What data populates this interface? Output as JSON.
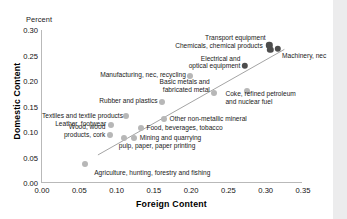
{
  "chart_data": {
    "type": "scatter",
    "title": "",
    "unit_label": "Percent",
    "xlabel": "Foreign Content",
    "ylabel": "Domestic Content",
    "xlim": [
      0.0,
      0.35
    ],
    "ylim": [
      0.0,
      0.3
    ],
    "xticks": [
      "0.00",
      "0.05",
      "0.10",
      "0.15",
      "0.20",
      "0.25",
      "0.30",
      "0.35"
    ],
    "yticks": [
      "0.00",
      "0.05",
      "0.10",
      "0.15",
      "0.20",
      "0.25",
      "0.30"
    ],
    "grid": false,
    "legend": "none",
    "marker_color": "#b7b7b7",
    "marker_color_highlight": "#4d4d4d",
    "trendline": {
      "x0": 0.075,
      "y0": 0.055,
      "x1": 0.325,
      "y1": 0.262
    },
    "points": [
      {
        "label": "Transport equipment",
        "x": 0.305,
        "y": 0.27,
        "highlight": true
      },
      {
        "label": "Chemicals, chemical products",
        "x": 0.306,
        "y": 0.261,
        "highlight": true
      },
      {
        "label": "Machinery, nec",
        "x": 0.316,
        "y": 0.263,
        "highlight": true
      },
      {
        "label": "Electrical and\noptical equipment",
        "x": 0.272,
        "y": 0.23,
        "highlight": true
      },
      {
        "label": "Manufacturing, nec, recycling",
        "x": 0.199,
        "y": 0.21,
        "highlight": false
      },
      {
        "label": "Coke, refined petroleum\nand nuclear fuel",
        "x": 0.275,
        "y": 0.181,
        "highlight": false
      },
      {
        "label": "Basic metals and\nfabricated metal",
        "x": 0.231,
        "y": 0.176,
        "highlight": false
      },
      {
        "label": "Rubber and plastics",
        "x": 0.161,
        "y": 0.158,
        "highlight": false
      },
      {
        "label": "Textiles and textile products",
        "x": 0.112,
        "y": 0.131,
        "highlight": false
      },
      {
        "label": "Other non-metallic mineral",
        "x": 0.164,
        "y": 0.125,
        "highlight": false
      },
      {
        "label": "Leather, footwear",
        "x": 0.092,
        "y": 0.114,
        "highlight": false
      },
      {
        "label": "Food, beverages, tobacco",
        "x": 0.133,
        "y": 0.107,
        "highlight": false
      },
      {
        "label": "Wood, wood\nproducts, cork",
        "x": 0.091,
        "y": 0.095,
        "highlight": false
      },
      {
        "label": "Mining and quarrying",
        "x": 0.124,
        "y": 0.088,
        "highlight": false
      },
      {
        "label": "pulp, paper, paper printing",
        "x": 0.11,
        "y": 0.088,
        "highlight": false
      },
      {
        "label": "Agriculture, hunting, forestry and fishing",
        "x": 0.057,
        "y": 0.038,
        "highlight": false
      }
    ]
  },
  "annotations": [
    {
      "text": "Transport equipment",
      "x": 0.3,
      "y": 0.285,
      "align": "right"
    },
    {
      "text": "Chemicals, chemical products",
      "x": 0.296,
      "y": 0.268,
      "align": "right"
    },
    {
      "text": "Machinery, nec",
      "x": 0.322,
      "y": 0.249,
      "align": "left"
    },
    {
      "text": "Electrical and\noptical equipment",
      "x": 0.266,
      "y": 0.236,
      "align": "right"
    },
    {
      "text": "Manufacturing, nec, recycling",
      "x": 0.193,
      "y": 0.212,
      "align": "right"
    },
    {
      "text": "Basic metals and\nfabricated metal",
      "x": 0.225,
      "y": 0.19,
      "align": "right"
    },
    {
      "text": "Coke, refined petroleum\nand nuclear fuel",
      "x": 0.246,
      "y": 0.166,
      "align": "left"
    },
    {
      "text": "Rubber and plastics",
      "x": 0.155,
      "y": 0.16,
      "align": "right"
    },
    {
      "text": "Textiles and textile products",
      "x": 0.106,
      "y": 0.132,
      "align": "right"
    },
    {
      "text": "Other non-metallic mineral",
      "x": 0.171,
      "y": 0.126,
      "align": "left"
    },
    {
      "text": "Leather, footwear",
      "x": 0.086,
      "y": 0.115,
      "align": "right"
    },
    {
      "text": "Food, beverages, tobacco",
      "x": 0.14,
      "y": 0.108,
      "align": "left"
    },
    {
      "text": "Wood, wood\nproducts, cork",
      "x": 0.085,
      "y": 0.101,
      "align": "right"
    },
    {
      "text": "Mining and quarrying",
      "x": 0.131,
      "y": 0.089,
      "align": "left"
    },
    {
      "text": "pulp, paper, paper printing",
      "x": 0.103,
      "y": 0.072,
      "align": "left"
    },
    {
      "text": "Agriculture, hunting, forestry and fishing",
      "x": 0.07,
      "y": 0.02,
      "align": "left"
    }
  ]
}
